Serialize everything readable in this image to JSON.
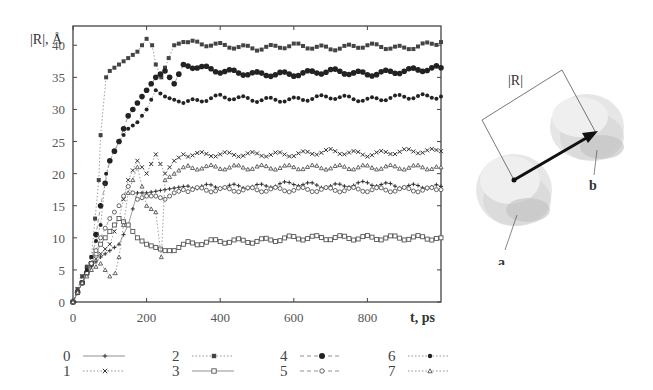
{
  "chart_data": {
    "type": "scatter",
    "title": "",
    "ylabel": "|R|, Å",
    "xlabel": "t, ps",
    "xlim": [
      0,
      1000
    ],
    "ylim": [
      0,
      43
    ],
    "x_ticks": [
      0,
      200,
      400,
      600,
      800
    ],
    "y_ticks": [
      0,
      5,
      10,
      15,
      20,
      25,
      30,
      35,
      40
    ],
    "grid": false,
    "legend_position": "bottom",
    "series": [
      {
        "name": "0",
        "marker": "plus",
        "line": "solid",
        "x": [
          0,
          25,
          50,
          75,
          100,
          125,
          150,
          175,
          200,
          250,
          300,
          400,
          500,
          600,
          700,
          800,
          900,
          1000
        ],
        "y": [
          0,
          3,
          5.5,
          7,
          8,
          9,
          12,
          17,
          17,
          17.5,
          18,
          18,
          18,
          18.5,
          18,
          18.5,
          18,
          18
        ]
      },
      {
        "name": "1",
        "marker": "x",
        "line": "dotted",
        "x": [
          0,
          25,
          50,
          75,
          100,
          125,
          150,
          175,
          200,
          225,
          250,
          275,
          300,
          400,
          500,
          600,
          700,
          800,
          900,
          1000
        ],
        "y": [
          0,
          4,
          6,
          7.5,
          9,
          13,
          19,
          22,
          20,
          23,
          20,
          22,
          23,
          23,
          23,
          23,
          23.5,
          23,
          23.5,
          23.5
        ]
      },
      {
        "name": "2",
        "marker": "filled-square",
        "line": "dotted",
        "x": [
          0,
          25,
          50,
          70,
          75,
          90,
          100,
          125,
          150,
          175,
          200,
          215,
          225,
          240,
          260,
          275,
          300,
          400,
          500,
          600,
          700,
          800,
          900,
          1000
        ],
        "y": [
          0,
          4,
          7,
          19,
          26,
          35,
          36,
          37,
          38,
          39,
          41,
          40,
          37,
          35,
          38,
          40,
          40.5,
          40,
          39.5,
          40,
          39.5,
          40,
          39.5,
          40.5
        ]
      },
      {
        "name": "3",
        "marker": "open-square",
        "line": "solid",
        "x": [
          0,
          25,
          50,
          75,
          100,
          125,
          150,
          175,
          200,
          225,
          250,
          275,
          300,
          400,
          500,
          600,
          700,
          800,
          900,
          1000
        ],
        "y": [
          0,
          3,
          6,
          9,
          11,
          13,
          12,
          10,
          9,
          8.5,
          8,
          8,
          9,
          9.5,
          9.5,
          10,
          10,
          10,
          10,
          10
        ]
      },
      {
        "name": "4",
        "marker": "filled-circle-large",
        "line": "dashed",
        "x": [
          0,
          25,
          50,
          75,
          100,
          125,
          150,
          175,
          200,
          225,
          250,
          275,
          300,
          400,
          500,
          600,
          700,
          800,
          900,
          1000
        ],
        "y": [
          0,
          3,
          6,
          15,
          22,
          25,
          29,
          31,
          33,
          35,
          36,
          34,
          37,
          36,
          35.5,
          35.5,
          36,
          35.5,
          36,
          36.5
        ]
      },
      {
        "name": "5",
        "marker": "open-circle",
        "line": "dashed",
        "x": [
          0,
          25,
          50,
          75,
          100,
          125,
          150,
          175,
          200,
          225,
          250,
          275,
          300,
          400,
          500,
          600,
          700,
          800,
          900,
          1000
        ],
        "y": [
          0,
          3,
          6,
          10,
          13,
          15,
          18,
          16,
          16.5,
          16.5,
          16,
          17,
          17.5,
          17.5,
          17.5,
          17.5,
          17.5,
          17.5,
          17.5,
          17.5
        ]
      },
      {
        "name": "6",
        "marker": "filled-circle",
        "line": "dotted",
        "x": [
          0,
          25,
          50,
          75,
          90,
          100,
          125,
          150,
          175,
          200,
          225,
          250,
          275,
          300,
          400,
          500,
          600,
          700,
          800,
          900,
          1000
        ],
        "y": [
          0,
          3,
          7,
          12,
          20,
          22,
          25,
          27,
          28,
          30,
          33,
          32,
          31.5,
          31,
          32,
          31.5,
          31.5,
          32,
          31.5,
          32,
          32
        ]
      },
      {
        "name": "7",
        "marker": "open-triangle",
        "line": "dotted",
        "x": [
          0,
          25,
          50,
          75,
          100,
          115,
          125,
          150,
          175,
          200,
          225,
          240,
          250,
          275,
          300,
          400,
          500,
          600,
          700,
          800,
          900,
          1000
        ],
        "y": [
          0,
          3,
          5,
          6,
          4,
          4.5,
          7,
          17,
          21,
          15,
          14,
          7,
          19,
          20,
          21,
          21,
          21,
          21,
          21,
          21,
          21,
          21
        ]
      }
    ]
  },
  "diagram": {
    "distance_label": "|R|",
    "domain_a_label": "a",
    "domain_b_label": "b"
  },
  "legend": {
    "items": [
      {
        "label": "0"
      },
      {
        "label": "1"
      },
      {
        "label": "2"
      },
      {
        "label": "3"
      },
      {
        "label": "4"
      },
      {
        "label": "5"
      },
      {
        "label": "6"
      },
      {
        "label": "7"
      }
    ]
  }
}
